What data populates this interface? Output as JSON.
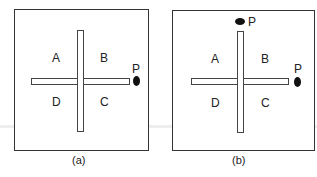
{
  "panels": [
    {
      "caption": "(a)",
      "quadrants": {
        "A": "A",
        "B": "B",
        "C": "C",
        "D": "D"
      },
      "markers": [
        {
          "label": "P",
          "position": "right"
        }
      ]
    },
    {
      "caption": "(b)",
      "quadrants": {
        "A": "A",
        "B": "B",
        "C": "C",
        "D": "D"
      },
      "markers": [
        {
          "label": "P",
          "position": "top"
        },
        {
          "label": "P",
          "position": "right"
        }
      ]
    }
  ]
}
